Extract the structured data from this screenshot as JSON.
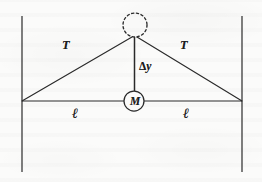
{
  "figure": {
    "domain_kind": "physics-free-body-diagram",
    "caption": "",
    "background_color": "#fbfbfa",
    "ink_color": "#2a2a2a",
    "labels": {
      "tension_left": "T",
      "tension_right": "T",
      "displacement": "Δy",
      "displacement_delta": "Δ",
      "displacement_variable": "y",
      "length_left": "ℓ",
      "length_right": "ℓ",
      "mass": "M"
    },
    "geometry": {
      "canvas_width": 262,
      "canvas_height": 182,
      "wall_left_x": 22,
      "wall_right_x": 242,
      "wall_top_y": 16,
      "wall_bottom_y": 172,
      "baseline_y": 101,
      "apex_x": 134,
      "apex_y": 37,
      "mass_center_x": 134,
      "mass_center_y": 101,
      "mass_radius": 10,
      "ghost_circle_center_x": 135,
      "ghost_circle_center_y": 25,
      "ghost_circle_radius": 12,
      "stroke_width": 1.15,
      "dash_pattern": "2.2 2.6"
    },
    "label_positions": {
      "tension_left": {
        "x": 62,
        "y": 39
      },
      "tension_right": {
        "x": 180,
        "y": 39
      },
      "displacement": {
        "x": 139,
        "y": 61
      },
      "length_left": {
        "x": 72,
        "y": 106
      },
      "length_right": {
        "x": 183,
        "y": 106
      }
    }
  }
}
